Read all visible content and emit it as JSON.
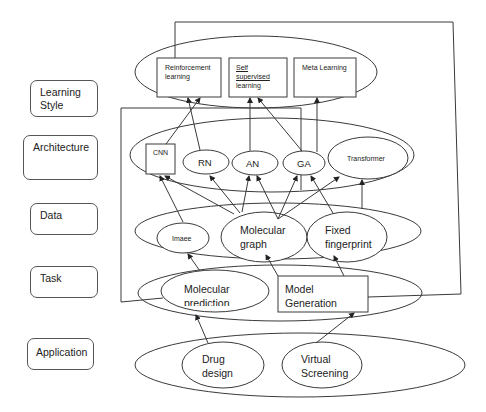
{
  "layers": [
    {
      "id": "learning_style",
      "label": "Learning Style"
    },
    {
      "id": "architecture",
      "label": "Architecture"
    },
    {
      "id": "data",
      "label": "Data"
    },
    {
      "id": "task",
      "label": "Task"
    },
    {
      "id": "application",
      "label": "Application"
    }
  ],
  "learning_style": {
    "reinforcement": "Reinforcement learning",
    "reinforcement_l1": "Reinforcement",
    "reinforcement_l2": "learning",
    "self_l1": "Self",
    "self_l2": "supervised",
    "self_l3": "learning",
    "meta": "Meta Learning"
  },
  "architecture": {
    "cnn": "CNN",
    "rn": "RN",
    "an": "AN",
    "ga": "GA",
    "transformer": "Transformer"
  },
  "data": {
    "image": "Imaee",
    "mol_graph_l1": "Molecular",
    "mol_graph_l2": "graph",
    "fingerprint_l1": "Fixed",
    "fingerprint_l2": "fingerprint"
  },
  "task": {
    "mol_pred_l1": "Molecular",
    "mol_pred_l2": "prediction",
    "model_gen_l1": "Model",
    "model_gen_l2": "Generation"
  },
  "application": {
    "drug_l1": "Drug",
    "drug_l2": "design",
    "vs_l1": "Virtual",
    "vs_l2": "Screening"
  },
  "edges": [
    {
      "from": "Drug design",
      "to": "Molecular prediction"
    },
    {
      "from": "Virtual Screening",
      "to": "Model Generation"
    },
    {
      "from": "Molecular prediction",
      "to": "Image"
    },
    {
      "from": "Model Generation",
      "to": "Molecular graph"
    },
    {
      "from": "Model Generation",
      "to": "Fixed fingerprint"
    },
    {
      "from": "Image",
      "to": "CNN"
    },
    {
      "from": "Molecular graph",
      "to": "CNN"
    },
    {
      "from": "Molecular graph",
      "to": "RN"
    },
    {
      "from": "Molecular graph",
      "to": "AN"
    },
    {
      "from": "Molecular graph",
      "to": "GA"
    },
    {
      "from": "Molecular graph",
      "to": "Transformer"
    },
    {
      "from": "Fixed fingerprint",
      "to": "GA"
    },
    {
      "from": "Fixed fingerprint",
      "to": "Transformer"
    },
    {
      "from": "CNN",
      "to": "Reinforcement learning"
    },
    {
      "from": "RN",
      "to": "Reinforcement learning"
    },
    {
      "from": "AN",
      "to": "Self supervised learning"
    },
    {
      "from": "GA",
      "to": "Self supervised learning"
    },
    {
      "from": "GA",
      "to": "Meta Learning"
    }
  ],
  "colors": {
    "line": "#3a3a3a",
    "background": "#ffffff",
    "text": "#222222"
  }
}
